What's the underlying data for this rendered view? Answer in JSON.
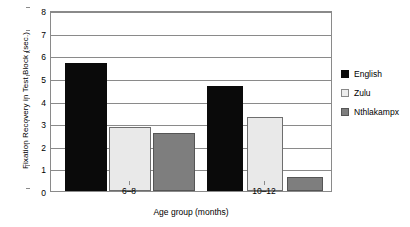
{
  "chart_data": {
    "type": "bar",
    "title": "",
    "xlabel": "Age group (months)",
    "ylabel": "Fixation Recovery in Test Block (sec.)",
    "categories": [
      "6–8",
      "10–12"
    ],
    "series": [
      {
        "name": "English",
        "values": [
          5.65,
          4.65
        ],
        "color": "#0a0a0a"
      },
      {
        "name": "Zulu",
        "values": [
          2.82,
          3.25
        ],
        "color": "#e9e9e9"
      },
      {
        "name": "Nthlakampx",
        "values": [
          2.55,
          0.6
        ],
        "color": "#7e7e7e"
      }
    ],
    "ylim": [
      0,
      8
    ],
    "yticks": [
      "0",
      "1",
      "2",
      "3",
      "4",
      "5",
      "6",
      "7",
      "8"
    ],
    "grid": true,
    "legend_position": "right"
  },
  "legend": {
    "items": [
      {
        "label": "English"
      },
      {
        "label": "Zulu"
      },
      {
        "label": "Nthlakampx"
      }
    ]
  }
}
